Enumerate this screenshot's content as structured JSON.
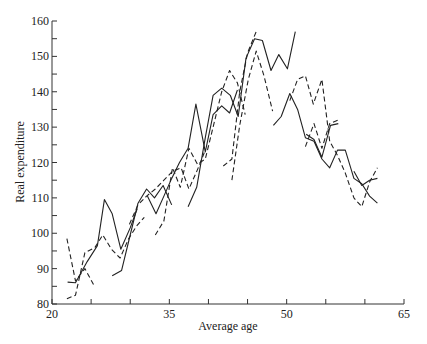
{
  "chart_data": {
    "type": "line",
    "title": "",
    "xlabel": "Average age",
    "ylabel": "Real expenditure",
    "xlim": [
      20,
      65
    ],
    "ylim": [
      80,
      160
    ],
    "x_ticks": [
      20,
      25,
      30,
      35,
      40,
      45,
      50,
      55,
      60,
      65
    ],
    "x_tick_labels": [
      "20",
      "",
      "",
      "35",
      "",
      "",
      "50",
      "",
      "",
      "65"
    ],
    "y_ticks": [
      80,
      85,
      90,
      95,
      100,
      105,
      110,
      115,
      120,
      125,
      130,
      135,
      140,
      145,
      150,
      155,
      160
    ],
    "y_tick_labels": [
      "80",
      "",
      "90",
      "",
      "100",
      "",
      "110",
      "",
      "120",
      "",
      "130",
      "",
      "140",
      "",
      "150",
      "",
      "160"
    ],
    "grid": false,
    "legend": null,
    "series": [
      {
        "name": "cohort-A",
        "style": "solid",
        "points": [
          [
            22.0,
            86.2
          ],
          [
            23.0,
            86.0
          ],
          [
            24.5,
            92.0
          ],
          [
            25.8,
            96.5
          ],
          [
            26.7,
            109.5
          ],
          [
            27.7,
            105.5
          ],
          [
            28.8,
            95.5
          ],
          [
            30.0,
            101.5
          ],
          [
            30.9,
            107.0
          ]
        ]
      },
      {
        "name": "cohort-B",
        "style": "dashed",
        "points": [
          [
            21.9,
            98.5
          ],
          [
            23.0,
            86.5
          ],
          [
            24.2,
            90.0
          ],
          [
            25.3,
            85.5
          ]
        ]
      },
      {
        "name": "cohort-C",
        "style": "dashed",
        "points": [
          [
            21.9,
            81.5
          ],
          [
            23.0,
            82.5
          ],
          [
            24.2,
            94.5
          ],
          [
            25.5,
            96.0
          ],
          [
            26.5,
            99.5
          ],
          [
            27.6,
            95.5
          ],
          [
            28.7,
            93.0
          ],
          [
            29.8,
            98.5
          ],
          [
            30.8,
            102.0
          ],
          [
            31.8,
            104.5
          ]
        ]
      },
      {
        "name": "cohort-D",
        "style": "solid",
        "points": [
          [
            27.7,
            88.0
          ],
          [
            28.9,
            89.5
          ],
          [
            30.0,
            99.5
          ],
          [
            31.0,
            108.5
          ],
          [
            32.1,
            112.5
          ],
          [
            33.1,
            110.0
          ],
          [
            34.2,
            113.5
          ],
          [
            35.3,
            108.0
          ]
        ]
      },
      {
        "name": "cohort-E",
        "style": "dashed",
        "points": [
          [
            29.9,
            102.5
          ],
          [
            31.0,
            108.0
          ],
          [
            32.1,
            110.5
          ],
          [
            33.2,
            112.5
          ],
          [
            34.3,
            115.0
          ],
          [
            35.4,
            117.5
          ],
          [
            36.5,
            118.5
          ],
          [
            37.5,
            112.5
          ],
          [
            38.6,
            118.0
          ],
          [
            39.6,
            123.5
          ]
        ]
      },
      {
        "name": "cohort-F",
        "style": "solid",
        "points": [
          [
            32.2,
            110.5
          ],
          [
            33.3,
            105.5
          ],
          [
            34.3,
            110.5
          ],
          [
            35.3,
            115.5
          ],
          [
            36.3,
            120.0
          ],
          [
            37.4,
            124.0
          ],
          [
            38.4,
            136.5
          ],
          [
            39.6,
            123.0
          ],
          [
            40.6,
            133.5
          ],
          [
            41.7,
            136.0
          ],
          [
            42.7,
            134.0
          ],
          [
            43.7,
            140.5
          ]
        ]
      },
      {
        "name": "cohort-G",
        "style": "dashed",
        "points": [
          [
            33.2,
            99.5
          ],
          [
            34.3,
            103.5
          ],
          [
            35.4,
            118.5
          ],
          [
            36.4,
            113.0
          ],
          [
            37.5,
            124.0
          ],
          [
            38.6,
            119.5
          ],
          [
            39.6,
            121.0
          ],
          [
            40.6,
            130.0
          ],
          [
            41.7,
            140.0
          ],
          [
            42.7,
            146.0
          ],
          [
            43.7,
            142.5
          ],
          [
            44.7,
            133.5
          ]
        ]
      },
      {
        "name": "cohort-H",
        "style": "solid",
        "points": [
          [
            37.4,
            107.5
          ],
          [
            38.5,
            113.0
          ],
          [
            39.6,
            127.0
          ],
          [
            40.6,
            139.0
          ],
          [
            41.7,
            141.0
          ],
          [
            42.8,
            139.0
          ],
          [
            43.8,
            133.0
          ],
          [
            44.8,
            149.5
          ],
          [
            45.9,
            155.0
          ],
          [
            46.9,
            154.5
          ],
          [
            48.0,
            146.0
          ],
          [
            49.0,
            150.5
          ],
          [
            50.1,
            146.5
          ],
          [
            51.1,
            157.0
          ]
        ]
      },
      {
        "name": "cohort-I",
        "style": "dashed",
        "points": [
          [
            41.9,
            119.0
          ],
          [
            43.0,
            121.0
          ],
          [
            44.0,
            140.0
          ],
          [
            45.0,
            151.0
          ],
          [
            46.1,
            157.0
          ]
        ]
      },
      {
        "name": "cohort-J",
        "style": "dashed",
        "points": [
          [
            43.0,
            115.0
          ],
          [
            44.0,
            130.5
          ],
          [
            45.1,
            143.5
          ],
          [
            46.1,
            151.5
          ],
          [
            47.1,
            144.5
          ],
          [
            48.2,
            134.5
          ]
        ]
      },
      {
        "name": "cohort-K",
        "style": "solid",
        "points": [
          [
            48.3,
            130.5
          ],
          [
            49.3,
            133.0
          ],
          [
            50.4,
            139.5
          ],
          [
            51.4,
            135.0
          ],
          [
            52.4,
            127.0
          ],
          [
            53.5,
            126.0
          ],
          [
            54.5,
            121.0
          ],
          [
            55.5,
            118.5
          ],
          [
            56.5,
            123.5
          ],
          [
            57.5,
            123.5
          ],
          [
            58.6,
            115.5
          ],
          [
            59.6,
            114.0
          ],
          [
            60.6,
            110.5
          ],
          [
            61.6,
            108.5
          ]
        ]
      },
      {
        "name": "cohort-L",
        "style": "dashed",
        "points": [
          [
            50.4,
            137.5
          ],
          [
            51.4,
            143.5
          ],
          [
            52.4,
            144.5
          ],
          [
            53.4,
            136.5
          ],
          [
            54.5,
            143.5
          ],
          [
            55.5,
            126.0
          ],
          [
            56.5,
            122.0
          ],
          [
            57.5,
            117.0
          ],
          [
            58.6,
            110.0
          ],
          [
            59.6,
            107.5
          ],
          [
            60.6,
            114.5
          ],
          [
            61.6,
            118.5
          ]
        ]
      },
      {
        "name": "cohort-M",
        "style": "dashed",
        "points": [
          [
            52.4,
            124.5
          ],
          [
            53.5,
            131.0
          ],
          [
            54.5,
            124.0
          ],
          [
            55.5,
            131.0
          ],
          [
            56.6,
            132.0
          ]
        ]
      },
      {
        "name": "cohort-N",
        "style": "solid",
        "points": [
          [
            52.5,
            128.0
          ],
          [
            53.5,
            126.5
          ],
          [
            54.5,
            121.5
          ],
          [
            55.6,
            130.5
          ],
          [
            56.6,
            131.0
          ]
        ]
      },
      {
        "name": "cohort-O",
        "style": "solid",
        "points": [
          [
            58.6,
            117.5
          ],
          [
            59.6,
            113.5
          ],
          [
            60.6,
            115.0
          ],
          [
            61.6,
            115.5
          ]
        ]
      }
    ]
  }
}
